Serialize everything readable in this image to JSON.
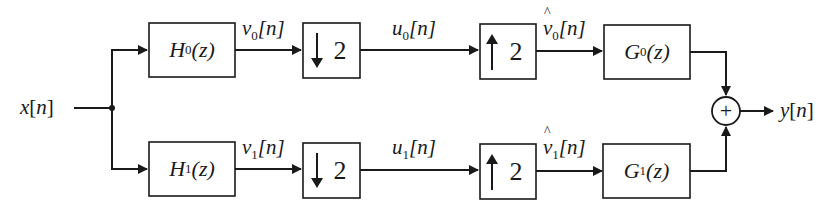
{
  "diagram": {
    "type": "two-channel filter bank",
    "input": {
      "name": "x",
      "index": "n"
    },
    "output": {
      "name": "y",
      "index": "n"
    },
    "adder_symbol": "+",
    "branches": [
      {
        "analysis_filter": {
          "name": "H",
          "sub": "0",
          "arg": "(z)"
        },
        "filtered_signal": {
          "name": "v",
          "sub": "0",
          "index": "[n]"
        },
        "downsampler": {
          "arrow": "down",
          "factor": "2"
        },
        "subband_signal": {
          "name": "u",
          "sub": "0",
          "index": "[n]"
        },
        "upsampler": {
          "arrow": "up",
          "factor": "2"
        },
        "upsampled_signal": {
          "name": "v̂",
          "base": "v",
          "sub": "0",
          "index": "[n]"
        },
        "synthesis_filter": {
          "name": "G",
          "sub": "0",
          "arg": "(z)"
        }
      },
      {
        "analysis_filter": {
          "name": "H",
          "sub": "1",
          "arg": "(z)"
        },
        "filtered_signal": {
          "name": "v",
          "sub": "1",
          "index": "[n]"
        },
        "downsampler": {
          "arrow": "down",
          "factor": "2"
        },
        "subband_signal": {
          "name": "u",
          "sub": "1",
          "index": "[n]"
        },
        "upsampler": {
          "arrow": "up",
          "factor": "2"
        },
        "upsampled_signal": {
          "name": "v̂",
          "base": "v",
          "sub": "1",
          "index": "[n]"
        },
        "synthesis_filter": {
          "name": "G",
          "sub": "1",
          "arg": "(z)"
        }
      }
    ],
    "labels": {
      "x_open": "[",
      "n": "n",
      "close": "]"
    }
  }
}
